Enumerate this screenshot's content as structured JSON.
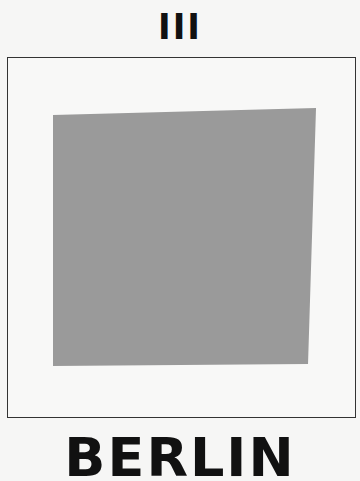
{
  "header": {
    "numeral": "III"
  },
  "artwork": {
    "frame_border_color": "#333333",
    "background_color": "#f6f6f5",
    "square_fill_color": "#9a9a9a",
    "square_shape": "gray quadrilateral"
  },
  "footer": {
    "city": "BERLIN"
  }
}
